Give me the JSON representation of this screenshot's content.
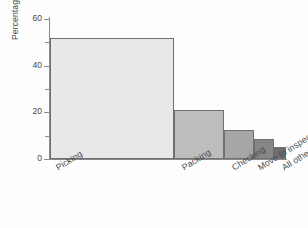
{
  "chart_data": {
    "type": "bar",
    "title": "",
    "xlabel": "",
    "ylabel": "Percentage of time",
    "categories": [
      "Picking",
      "Packing",
      "Checking",
      "Move to inspection",
      "All others"
    ],
    "values": [
      52,
      21,
      12.5,
      8.5,
      5
    ],
    "ylim": [
      0,
      60
    ],
    "yticks": [
      0,
      20,
      40,
      60
    ],
    "ytick_labels": [
      "0",
      "20",
      "40",
      "60"
    ],
    "yminor_ticks": [
      10,
      30,
      50
    ],
    "grid": false,
    "legend": "none",
    "bar_colors": [
      "#e8e8e8",
      "#bdbdbd",
      "#a6a6a6",
      "#868686",
      "#6e6e6e"
    ],
    "bar_edge_color": "#6f6f6f",
    "axis_color": "#8a8a8a",
    "background": "#fdfdfd",
    "text_color": "#4a4a4a",
    "xlabel_rotation_deg": -32
  }
}
